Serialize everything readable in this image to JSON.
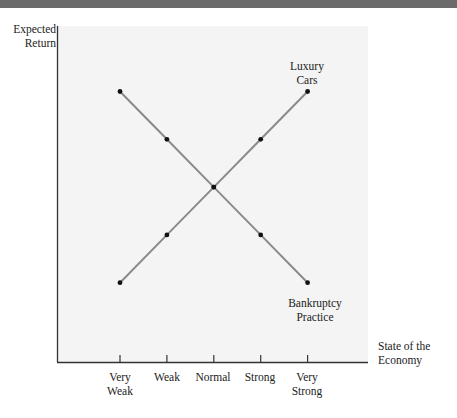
{
  "chart_data": {
    "type": "line",
    "title": "",
    "xlabel": "State of the Economy",
    "ylabel": "Expected Return",
    "categories": [
      "Very Weak",
      "Weak",
      "Normal",
      "Strong",
      "Very Strong"
    ],
    "series": [
      {
        "name": "Luxury Cars",
        "values": [
          1,
          2,
          3,
          4,
          5
        ]
      },
      {
        "name": "Bankruptcy Practice",
        "values": [
          5,
          4,
          3,
          2,
          1
        ]
      }
    ],
    "ylim": [
      0,
      6
    ],
    "grid": false,
    "legend": "inline labels at line ends",
    "line_color": "#8a8a8a",
    "marker_color": "#111111",
    "axis_color": "#333333",
    "plot_background": "#f4f4f4"
  },
  "labels": {
    "y_axis_line1": "Expected",
    "y_axis_line2": "Return",
    "x_axis_line1": "State of the",
    "x_axis_line2": "Economy",
    "series_luxury_line1": "Luxury",
    "series_luxury_line2": "Cars",
    "series_bankruptcy_line1": "Bankruptcy",
    "series_bankruptcy_line2": "Practice",
    "ticks": [
      {
        "line1": "Very",
        "line2": "Weak"
      },
      {
        "line1": "Weak",
        "line2": ""
      },
      {
        "line1": "Normal",
        "line2": ""
      },
      {
        "line1": "Strong",
        "line2": ""
      },
      {
        "line1": "Very",
        "line2": "Strong"
      }
    ]
  }
}
